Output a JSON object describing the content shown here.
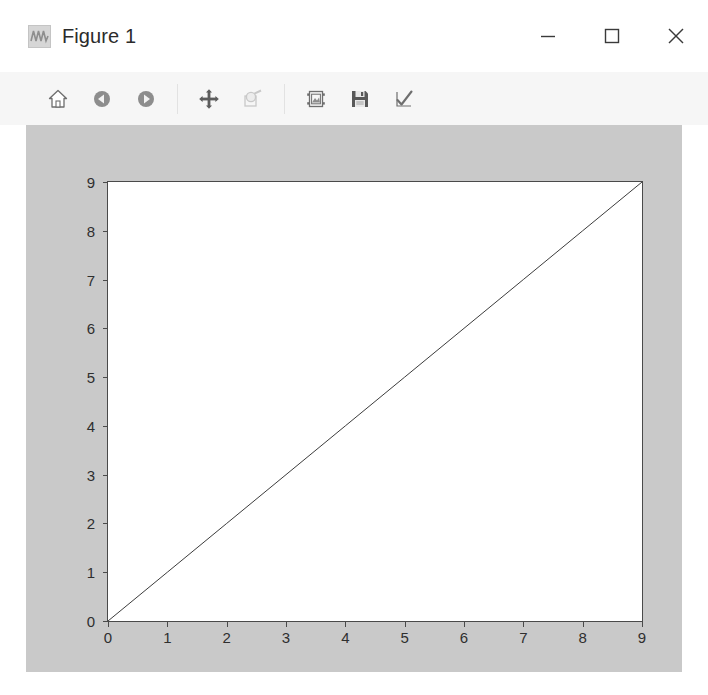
{
  "window": {
    "title": "Figure 1",
    "app_icon": "waveform-icon",
    "controls": [
      {
        "name": "minimize-button",
        "glyph": "minimize-icon",
        "label": "Minimize"
      },
      {
        "name": "maximize-button",
        "glyph": "maximize-icon",
        "label": "Maximize"
      },
      {
        "name": "close-button",
        "glyph": "close-icon",
        "label": "Close"
      }
    ]
  },
  "toolbar": {
    "background": "#f6f6f6",
    "buttons": [
      {
        "name": "home-button",
        "icon": "home-icon",
        "tooltip": "Reset original view",
        "enabled": true
      },
      {
        "name": "back-button",
        "icon": "arrow-left-circle-icon",
        "tooltip": "Back to previous view",
        "enabled": true
      },
      {
        "name": "forward-button",
        "icon": "arrow-right-circle-icon",
        "tooltip": "Forward to next view",
        "enabled": true
      },
      {
        "name": "separator-1",
        "icon": "separator",
        "tooltip": "",
        "enabled": false
      },
      {
        "name": "pan-button",
        "icon": "move-cross-icon",
        "tooltip": "Pan axes with left mouse, zoom with right",
        "enabled": true
      },
      {
        "name": "zoom-rect-button",
        "icon": "zoom-rect-icon",
        "tooltip": "Zoom to rectangle",
        "enabled": false
      },
      {
        "name": "separator-2",
        "icon": "separator",
        "tooltip": "",
        "enabled": false
      },
      {
        "name": "configure-subplots-button",
        "icon": "subplots-icon",
        "tooltip": "Configure subplots",
        "enabled": true
      },
      {
        "name": "save-figure-button",
        "icon": "floppy-save-icon",
        "tooltip": "Save the figure",
        "enabled": true
      },
      {
        "name": "edit-axis-button",
        "icon": "checkmark-icon",
        "tooltip": "Edit axis, curve and image parameters",
        "enabled": true
      }
    ]
  },
  "figure": {
    "facecolor": "#c9c9c9",
    "axes_facecolor": "#ffffff",
    "spine_color": "#4a4a4a",
    "line_color": "#3c3c3c"
  },
  "chart_data": {
    "type": "line",
    "title": "",
    "xlabel": "",
    "ylabel": "",
    "xlim": [
      0,
      9
    ],
    "ylim": [
      0,
      9
    ],
    "xticks": [
      0,
      1,
      2,
      3,
      4,
      5,
      6,
      7,
      8,
      9
    ],
    "yticks": [
      0,
      1,
      2,
      3,
      4,
      5,
      6,
      7,
      8,
      9
    ],
    "xticklabels": [
      "0",
      "1",
      "2",
      "3",
      "4",
      "5",
      "6",
      "7",
      "8",
      "9"
    ],
    "yticklabels": [
      "0",
      "1",
      "2",
      "3",
      "4",
      "5",
      "6",
      "7",
      "8",
      "9"
    ],
    "grid": false,
    "legend": null,
    "series": [
      {
        "name": "y = x",
        "color": "#3c3c3c",
        "linewidth": 1,
        "x": [
          0,
          1,
          2,
          3,
          4,
          5,
          6,
          7,
          8,
          9
        ],
        "y": [
          0,
          1,
          2,
          3,
          4,
          5,
          6,
          7,
          8,
          9
        ]
      }
    ]
  }
}
